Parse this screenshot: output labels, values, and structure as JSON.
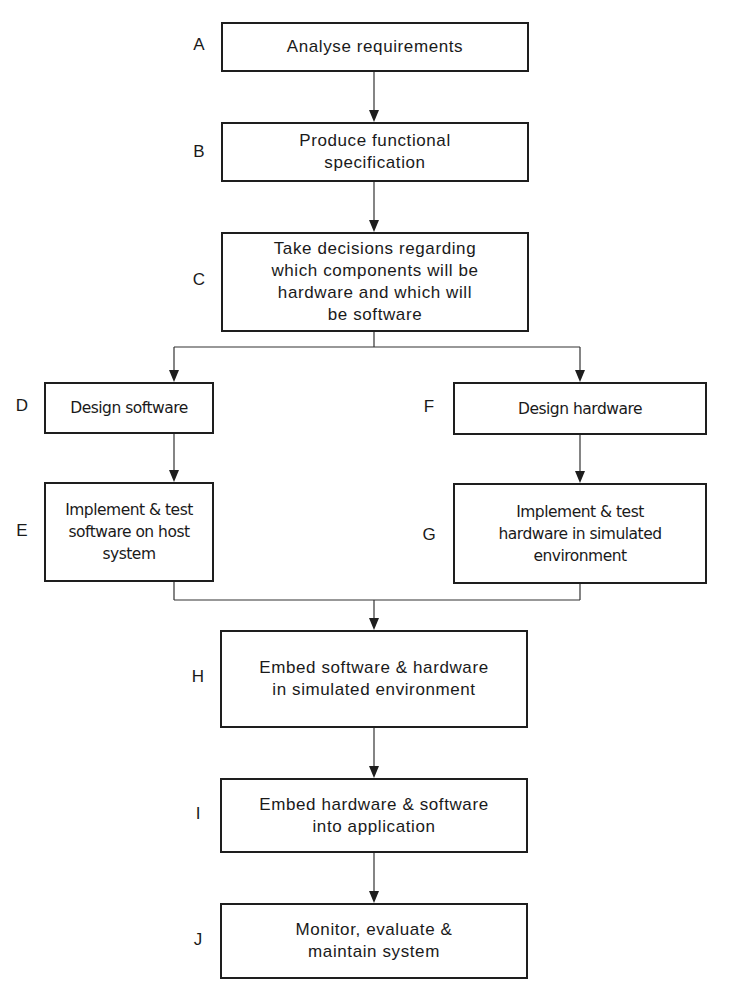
{
  "diagram": {
    "type": "flowchart",
    "steps": [
      {
        "id": "A",
        "text": "Analyse requirements"
      },
      {
        "id": "B",
        "text": "Produce functional\nspecification"
      },
      {
        "id": "C",
        "text": "Take decisions regarding\nwhich components will be\nhardware and which will\nbe software"
      },
      {
        "id": "D",
        "text": "Design software"
      },
      {
        "id": "E",
        "text": "Implement & test\nsoftware on host\nsystem"
      },
      {
        "id": "F",
        "text": "Design hardware"
      },
      {
        "id": "G",
        "text": "Implement & test\nhardware in simulated\nenvironment"
      },
      {
        "id": "H",
        "text": "Embed software & hardware\nin simulated environment"
      },
      {
        "id": "I",
        "text": "Embed hardware & software\ninto application"
      },
      {
        "id": "J",
        "text": "Monitor, evaluate &\nmaintain system"
      }
    ],
    "edges": [
      [
        "A",
        "B"
      ],
      [
        "B",
        "C"
      ],
      [
        "C",
        "D"
      ],
      [
        "C",
        "F"
      ],
      [
        "D",
        "E"
      ],
      [
        "F",
        "G"
      ],
      [
        "E",
        "H"
      ],
      [
        "G",
        "H"
      ],
      [
        "H",
        "I"
      ],
      [
        "I",
        "J"
      ]
    ]
  }
}
